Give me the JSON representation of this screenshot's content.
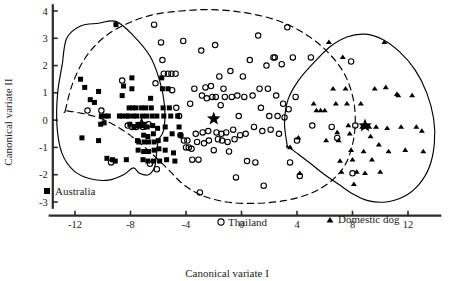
{
  "chart_data": {
    "type": "scatter",
    "title": "",
    "xlabel": "Canonical variate I",
    "ylabel": "Canonical variate II",
    "xlim": [
      -14,
      14.5
    ],
    "ylim": [
      -3.4,
      4.2
    ],
    "xticks": [
      -12,
      -8,
      -4,
      0,
      4,
      8,
      12
    ],
    "xtick_labels": [
      "-12",
      "-8",
      "-4",
      "0",
      "4",
      "8",
      "12"
    ],
    "yticks": [
      -3,
      -2,
      -1,
      0,
      1,
      2,
      3,
      4
    ],
    "ytick_labels": [
      "-3",
      "-2",
      "-1",
      "0",
      "1",
      "2",
      "3",
      "4"
    ],
    "grid": false,
    "legend_position": "inside",
    "series": [
      {
        "name": "Australia",
        "marker": "filled-square",
        "color": "#000000",
        "legend_label": "Australia",
        "centroid": [
          -7.2,
          -0.15
        ],
        "points": [
          [
            -11.6,
            1.5
          ],
          [
            -11.3,
            1.2
          ],
          [
            -11.5,
            -0.65
          ],
          [
            -10.9,
            0.75
          ],
          [
            -10.6,
            0.65
          ],
          [
            -10.3,
            1.05
          ],
          [
            -10.1,
            0.15
          ],
          [
            -10.15,
            -0.15
          ],
          [
            -10.3,
            -0.75
          ],
          [
            -9.9,
            -0.1
          ],
          [
            -9.85,
            0.15
          ],
          [
            -9.6,
            0.15
          ],
          [
            -9.7,
            -1.4
          ],
          [
            -9.3,
            -1.45
          ],
          [
            -9.1,
            -1.5
          ],
          [
            -9.05,
            3.5
          ],
          [
            -8.8,
            0.15
          ],
          [
            -8.6,
            0.15
          ],
          [
            -8.5,
            1.25
          ],
          [
            -8.6,
            0.9
          ],
          [
            -8.3,
            0.15
          ],
          [
            -8.1,
            0.45
          ],
          [
            -8.15,
            0.15
          ],
          [
            -8.05,
            -0.15
          ],
          [
            -8.3,
            -1.45
          ],
          [
            -7.9,
            1.55
          ],
          [
            -7.9,
            1.15
          ],
          [
            -7.85,
            0.45
          ],
          [
            -7.8,
            0.15
          ],
          [
            -7.75,
            -0.25
          ],
          [
            -7.6,
            0.45
          ],
          [
            -7.55,
            0.15
          ],
          [
            -7.45,
            -0.2
          ],
          [
            -7.5,
            -0.75
          ],
          [
            -7.4,
            -0.8
          ],
          [
            -7.45,
            -1.1
          ],
          [
            -7.2,
            0.45
          ],
          [
            -7.15,
            0.15
          ],
          [
            -7.1,
            -0.2
          ],
          [
            -7.05,
            -0.55
          ],
          [
            -7.0,
            -0.8
          ],
          [
            -7.05,
            -1.15
          ],
          [
            -7.1,
            -1.45
          ],
          [
            -6.9,
            0.45
          ],
          [
            -6.85,
            0.15
          ],
          [
            -6.8,
            -0.25
          ],
          [
            -6.75,
            -0.6
          ],
          [
            -6.7,
            -0.8
          ],
          [
            -6.7,
            -1.15
          ],
          [
            -6.75,
            -1.5
          ],
          [
            -6.55,
            0.8
          ],
          [
            -6.5,
            0.45
          ],
          [
            -6.45,
            0.15
          ],
          [
            -6.4,
            -0.2
          ],
          [
            -6.35,
            -0.5
          ],
          [
            -6.3,
            -0.8
          ],
          [
            -6.3,
            -1.1
          ],
          [
            -6.35,
            -1.5
          ],
          [
            -6.1,
            0.15
          ],
          [
            -6.05,
            -0.3
          ],
          [
            -6.0,
            -0.75
          ],
          [
            -5.95,
            -1.05
          ],
          [
            -5.9,
            -1.5
          ],
          [
            -5.75,
            1.55
          ],
          [
            -5.7,
            1.15
          ],
          [
            -5.65,
            0.45
          ],
          [
            -5.6,
            0.15
          ],
          [
            -5.5,
            -0.25
          ],
          [
            -5.45,
            -0.7
          ],
          [
            -5.5,
            -1.1
          ],
          [
            -5.4,
            -1.45
          ],
          [
            -5.3,
            1.15
          ],
          [
            -5.2,
            0.45
          ],
          [
            -5.1,
            0.15
          ],
          [
            -5.0,
            -0.5
          ],
          [
            -4.9,
            -1.2
          ],
          [
            -4.8,
            -1.5
          ],
          [
            -4.6,
            0.15
          ],
          [
            -4.5,
            -0.25
          ],
          [
            -4.4,
            -0.55
          ]
        ]
      },
      {
        "name": "Thailand",
        "marker": "open-circle",
        "color": "#000000",
        "legend_label": "Thailand",
        "centroid": [
          -2.0,
          0.05
        ],
        "points": [
          [
            -11.1,
            0.35
          ],
          [
            -10.1,
            0.35
          ],
          [
            -9.4,
            -1.55
          ],
          [
            -8.6,
            1.45
          ],
          [
            -8.2,
            -0.2
          ],
          [
            -7.9,
            -0.25
          ],
          [
            -7.6,
            -0.25
          ],
          [
            -7.1,
            -0.25
          ],
          [
            -6.7,
            -0.15
          ],
          [
            -6.6,
            -1.6
          ],
          [
            -6.3,
            3.5
          ],
          [
            -6.2,
            1.35
          ],
          [
            -6.1,
            -1.8
          ],
          [
            -5.8,
            2.85
          ],
          [
            -5.7,
            2.2
          ],
          [
            -5.6,
            1.7
          ],
          [
            -5.3,
            1.7
          ],
          [
            -5.05,
            1.7
          ],
          [
            -5.0,
            1.1
          ],
          [
            -4.75,
            1.7
          ],
          [
            -4.7,
            0.45
          ],
          [
            -4.5,
            0.15
          ],
          [
            -4.4,
            -0.55
          ],
          [
            -4.2,
            2.9
          ],
          [
            -4.15,
            -0.75
          ],
          [
            -4.0,
            -1.0
          ],
          [
            -3.9,
            -0.75
          ],
          [
            -3.8,
            -1.0
          ],
          [
            -3.7,
            0.6
          ],
          [
            -3.6,
            -1.05
          ],
          [
            -3.55,
            -1.45
          ],
          [
            -3.4,
            1.15
          ],
          [
            -3.3,
            -0.5
          ],
          [
            -3.2,
            -0.8
          ],
          [
            -3.1,
            -1.45
          ],
          [
            -3.0,
            -2.65
          ],
          [
            -2.9,
            2.55
          ],
          [
            -2.85,
            0.9
          ],
          [
            -2.8,
            -0.45
          ],
          [
            -2.7,
            -0.85
          ],
          [
            -2.6,
            1.2
          ],
          [
            -2.5,
            0.8
          ],
          [
            -2.4,
            -0.4
          ],
          [
            -2.35,
            -0.75
          ],
          [
            -2.2,
            1.25
          ],
          [
            -2.1,
            0.85
          ],
          [
            -2.0,
            -1.1
          ],
          [
            -1.9,
            2.75
          ],
          [
            -1.85,
            0.85
          ],
          [
            -1.8,
            -0.45
          ],
          [
            -1.7,
            -0.7
          ],
          [
            -1.6,
            1.6
          ],
          [
            -1.5,
            0.55
          ],
          [
            -1.45,
            -0.5
          ],
          [
            -1.4,
            -0.75
          ],
          [
            -1.3,
            1.15
          ],
          [
            -1.2,
            0.85
          ],
          [
            -1.1,
            -0.45
          ],
          [
            -1.0,
            -0.8
          ],
          [
            -0.9,
            -1.15
          ],
          [
            -0.8,
            1.8
          ],
          [
            -0.7,
            0.85
          ],
          [
            -0.6,
            -0.35
          ],
          [
            -0.5,
            -0.7
          ],
          [
            -0.4,
            -2.1
          ],
          [
            -0.3,
            0.9
          ],
          [
            -0.2,
            0.15
          ],
          [
            -0.1,
            -0.55
          ],
          [
            0.1,
            1.6
          ],
          [
            0.2,
            0.85
          ],
          [
            0.3,
            -0.5
          ],
          [
            0.4,
            -1.5
          ],
          [
            0.6,
            2.2
          ],
          [
            0.8,
            0.9
          ],
          [
            0.9,
            -0.25
          ],
          [
            1.0,
            -1.55
          ],
          [
            1.2,
            3.1
          ],
          [
            1.3,
            1.15
          ],
          [
            1.4,
            0.45
          ],
          [
            1.5,
            -0.4
          ],
          [
            1.6,
            -2.4
          ],
          [
            1.8,
            2.0
          ],
          [
            1.9,
            1.15
          ],
          [
            2.0,
            0.15
          ],
          [
            2.1,
            -0.35
          ],
          [
            2.3,
            2.3
          ],
          [
            2.4,
            2.3
          ],
          [
            2.5,
            0.9
          ],
          [
            2.6,
            0.15
          ],
          [
            2.7,
            -0.5
          ],
          [
            2.9,
            2.05
          ],
          [
            3.0,
            0.6
          ],
          [
            3.1,
            0.1
          ],
          [
            3.3,
            3.4
          ],
          [
            3.4,
            0.4
          ],
          [
            3.5,
            -1.55
          ],
          [
            3.7,
            2.3
          ],
          [
            3.9,
            0.85
          ],
          [
            4.0,
            -0.75
          ],
          [
            4.2,
            -2.05
          ],
          [
            5.0,
            2.3
          ],
          [
            5.1,
            -0.2
          ],
          [
            6.5,
            -0.25
          ],
          [
            6.9,
            -0.65
          ],
          [
            7.9,
            2.15
          ],
          [
            8.2,
            -0.2
          ],
          [
            8.0,
            -1.95
          ]
        ]
      },
      {
        "name": "Domestic dog",
        "marker": "filled-triangle",
        "color": "#000000",
        "legend_label": "Domestic dog",
        "centroid": [
          8.9,
          -0.2
        ],
        "points": [
          [
            3.5,
            -1.0
          ],
          [
            4.1,
            -0.65
          ],
          [
            4.2,
            -1.95
          ],
          [
            5.2,
            0.6
          ],
          [
            5.4,
            0.35
          ],
          [
            5.7,
            0.35
          ],
          [
            6.0,
            0.35
          ],
          [
            6.1,
            -0.75
          ],
          [
            6.3,
            2.85
          ],
          [
            6.6,
            1.15
          ],
          [
            6.8,
            0.6
          ],
          [
            6.9,
            -0.45
          ],
          [
            7.0,
            -0.75
          ],
          [
            7.1,
            -1.5
          ],
          [
            7.2,
            -1.9
          ],
          [
            7.3,
            2.3
          ],
          [
            7.5,
            1.15
          ],
          [
            7.6,
            0.6
          ],
          [
            7.7,
            -0.2
          ],
          [
            7.8,
            -0.5
          ],
          [
            7.9,
            -1.1
          ],
          [
            8.0,
            -1.45
          ],
          [
            8.1,
            -2.35
          ],
          [
            8.3,
            -1.9
          ],
          [
            8.6,
            0.6
          ],
          [
            8.7,
            -0.25
          ],
          [
            8.8,
            -1.15
          ],
          [
            8.9,
            -1.95
          ],
          [
            9.2,
            -0.25
          ],
          [
            9.3,
            -0.6
          ],
          [
            9.4,
            -1.45
          ],
          [
            9.6,
            1.15
          ],
          [
            9.7,
            -0.25
          ],
          [
            9.9,
            -0.9
          ],
          [
            10.0,
            -1.9
          ],
          [
            10.3,
            2.85
          ],
          [
            10.4,
            1.2
          ],
          [
            10.5,
            -0.3
          ],
          [
            10.6,
            -1.15
          ],
          [
            11.2,
            0.95
          ],
          [
            11.3,
            0.9
          ],
          [
            11.5,
            -0.25
          ],
          [
            11.8,
            -1.1
          ],
          [
            12.3,
            0.9
          ],
          [
            12.6,
            -0.25
          ],
          [
            13.0,
            -0.4
          ],
          [
            13.1,
            -1.15
          ]
        ]
      }
    ],
    "centroid_marker": "filled-star",
    "hulls": [
      {
        "name": "australia-thailand-solid-hull",
        "style": "solid"
      },
      {
        "name": "thailand-dashed-hull",
        "style": "dashed"
      },
      {
        "name": "dog-solid-hull",
        "style": "solid"
      }
    ]
  },
  "axis": {
    "xlabel": "Canonical variate I",
    "ylabel": "Canonical variate II"
  },
  "legend": {
    "australia": "Australia",
    "thailand": "Thailand",
    "domestic_dog": "Domestic dog"
  }
}
